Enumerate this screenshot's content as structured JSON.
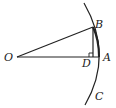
{
  "diagram": {
    "points": {
      "O": {
        "label": "O",
        "x": 17,
        "y": 57
      },
      "B": {
        "label": "B",
        "x": 93,
        "y": 27
      },
      "A": {
        "label": "A",
        "x": 99,
        "y": 57
      },
      "D": {
        "label": "D",
        "x": 93,
        "y": 57
      },
      "C": {
        "label": "C"
      }
    },
    "segments": [
      "OB",
      "OA",
      "BD"
    ],
    "arc": {
      "from": "top",
      "through": [
        "B",
        "A"
      ],
      "to": "C"
    },
    "right_angle_at": "D",
    "colors": {
      "stroke": "#222222",
      "background": "#ffffff"
    }
  }
}
